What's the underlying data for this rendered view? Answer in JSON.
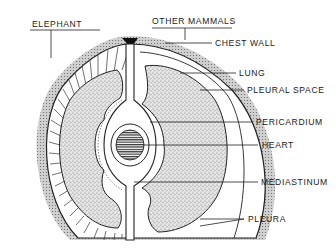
{
  "diagram": {
    "title_left": "ELEPHANT",
    "title_right": "OTHER MAMMALS",
    "labels": [
      {
        "id": "chest-wall",
        "text": "CHEST WALL"
      },
      {
        "id": "lung",
        "text": "LUNG"
      },
      {
        "id": "pleural-space",
        "text": "PLEURAL SPACE"
      },
      {
        "id": "pericardium",
        "text": "PERICARDIUM"
      },
      {
        "id": "heart",
        "text": "HEART"
      },
      {
        "id": "mediastinum",
        "text": "MEDIASTINUM"
      },
      {
        "id": "pleura",
        "text": "PLEURA"
      }
    ]
  },
  "colors": {
    "ink": "#1a1a1a",
    "stipple": "#9a9a9a",
    "background": "#ffffff"
  }
}
